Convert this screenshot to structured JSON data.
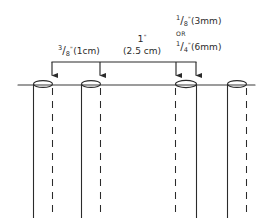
{
  "diagram": {
    "colors": {
      "ink": "#2b2b2b",
      "line": "#3a3a3a",
      "background": "#ffffff"
    },
    "baseline": {
      "label": "ground-line",
      "x_start": 18,
      "x_end": 255,
      "y": 85
    },
    "dimension_bracket": {
      "y": 62,
      "x_start": 52,
      "x_end": 196,
      "arrow_positions": [
        52,
        100,
        176,
        196
      ]
    },
    "labels": {
      "spacing_left": {
        "numerator": "3",
        "slash": "/",
        "denominator": "8",
        "inch": "\"",
        "metric": "(1cm)"
      },
      "spacing_center": {
        "value": "1",
        "inch": "\"",
        "metric": "(2.5 cm)"
      },
      "thickness": {
        "option_one": {
          "numerator": "1",
          "slash": "/",
          "denominator": "8",
          "inch": "\"",
          "metric": "(3mm)"
        },
        "conjunction": "OR",
        "option_two": {
          "numerator": "1",
          "slash": "/",
          "denominator": "4",
          "inch": "\"",
          "metric": "(6mm)"
        }
      }
    },
    "tubes": [
      {
        "name": "tube-1",
        "left_wall_x": 34,
        "right_wall_x": 52,
        "ellipse_cx": 43,
        "ellipse_rx": 9.5,
        "ellipse_ry": 3.4,
        "top_y": 85,
        "bottom_y": 218
      },
      {
        "name": "tube-2",
        "left_wall_x": 82,
        "right_wall_x": 100,
        "ellipse_cx": 91,
        "ellipse_rx": 9.5,
        "ellipse_ry": 3.4,
        "top_y": 85,
        "bottom_y": 218
      },
      {
        "name": "tube-3",
        "left_wall_x": 176,
        "right_wall_x": 196,
        "ellipse_cx": 186,
        "ellipse_rx": 10.5,
        "ellipse_ry": 3.6,
        "top_y": 85,
        "bottom_y": 218
      },
      {
        "name": "tube-4",
        "left_wall_x": 228,
        "right_wall_x": 246,
        "ellipse_cx": 237,
        "ellipse_rx": 9.5,
        "ellipse_ry": 3.4,
        "top_y": 85,
        "bottom_y": 218
      }
    ]
  }
}
